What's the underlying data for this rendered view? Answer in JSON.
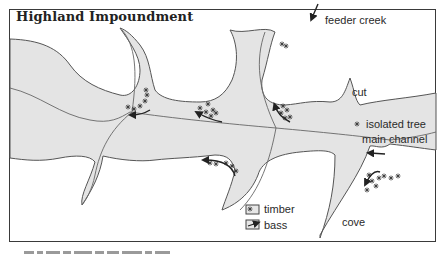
{
  "figure": {
    "title": "Highland Impoundment",
    "colors": {
      "water": "#e4e4e4",
      "shoreline": "#555555",
      "border": "#3a3a3a",
      "background": "#ffffff",
      "text": "#2a2a2a"
    }
  },
  "labels": {
    "feeder_creek": "feeder creek",
    "cut": "cut",
    "isolated_tree": "isolated tree",
    "main_channel": "main channel",
    "cove": "cove"
  },
  "legend": {
    "items": [
      {
        "icon": "timber-icon",
        "label": "timber"
      },
      {
        "icon": "bass-arrow-icon",
        "label": "bass"
      }
    ]
  },
  "caption": {
    "visible": "partially cut off at bottom edge (illegible)"
  }
}
